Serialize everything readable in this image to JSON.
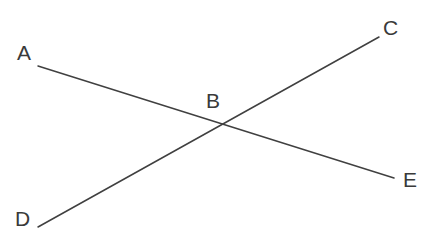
{
  "diagram": {
    "type": "geometry-line-diagram",
    "width": 438,
    "height": 250,
    "background_color": "#ffffff",
    "line_color": "#404040",
    "label_color": "#3a3a3a",
    "line_width": 1.5,
    "points": {
      "A": {
        "label": "A",
        "x": 38,
        "y": 66
      },
      "B": {
        "label": "B",
        "x": 222,
        "y": 125
      },
      "C": {
        "label": "C",
        "x": 379,
        "y": 37
      },
      "D": {
        "label": "D",
        "x": 38,
        "y": 227
      },
      "E": {
        "label": "E",
        "x": 394,
        "y": 178
      }
    },
    "segments": [
      {
        "name": "line-AE",
        "from": "A",
        "to": "E",
        "x1": 38,
        "y1": 66,
        "x2": 394,
        "y2": 178,
        "passes_through": "B"
      },
      {
        "name": "line-DC",
        "from": "D",
        "to": "C",
        "x1": 38,
        "y1": 227,
        "x2": 379,
        "y2": 37,
        "passes_through": "B"
      }
    ],
    "labels": [
      {
        "id": "A",
        "text": "A",
        "x": 17,
        "y": 42
      },
      {
        "id": "B",
        "text": "B",
        "x": 206,
        "y": 90
      },
      {
        "id": "C",
        "text": "C",
        "x": 383,
        "y": 17
      },
      {
        "id": "D",
        "text": "D",
        "x": 15,
        "y": 208
      },
      {
        "id": "E",
        "text": "E",
        "x": 403,
        "y": 169
      }
    ]
  }
}
